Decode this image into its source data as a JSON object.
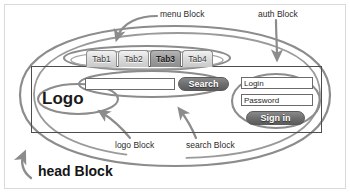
{
  "diagram": {
    "stroke_color": "#8c8c8c",
    "box_border_color": "#4d4d4d"
  },
  "head_block": {
    "label": "head Block"
  },
  "menu": {
    "annotation_label": "menu Block",
    "tabs": [
      {
        "label": "Tab1",
        "active": false
      },
      {
        "label": "Tab2",
        "active": false
      },
      {
        "label": "Tab3",
        "active": true
      },
      {
        "label": "Tab4",
        "active": false
      }
    ]
  },
  "logo": {
    "annotation_label": "logo Block",
    "text": "Logo"
  },
  "search": {
    "annotation_label": "search Block",
    "input_value": "",
    "input_placeholder": "",
    "button_label": "Search"
  },
  "auth": {
    "annotation_label": "auth Block",
    "login_value": "Login",
    "password_value": "Password",
    "signin_label": "Sign in"
  }
}
